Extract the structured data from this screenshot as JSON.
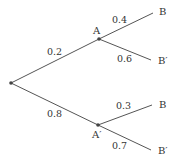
{
  "tree": {
    "root": {
      "x": 11,
      "y": 83
    },
    "nodes": [
      {
        "id": "A",
        "label": "A",
        "x": 99,
        "y": 39,
        "lx": 93,
        "ly": 34
      },
      {
        "id": "A_prime",
        "label": "A′",
        "x": 98,
        "y": 125,
        "lx": 92,
        "ly": 138
      }
    ],
    "leaves": [
      {
        "id": "B_upper",
        "label": "B",
        "x": 153,
        "y": 13,
        "lx": 159,
        "ly": 15
      },
      {
        "id": "Bp_upper",
        "label": "B′",
        "x": 151,
        "y": 60,
        "lx": 158,
        "ly": 64
      },
      {
        "id": "B_lower",
        "label": "B",
        "x": 152,
        "y": 105,
        "lx": 159,
        "ly": 108
      },
      {
        "id": "Bp_lower",
        "label": "B′",
        "x": 151,
        "y": 150,
        "lx": 158,
        "ly": 154
      }
    ],
    "edges": [
      {
        "from": "root",
        "to": "A",
        "prob": "0.2",
        "px": 47,
        "py": 55
      },
      {
        "from": "root",
        "to": "A_prime",
        "prob": "0.8",
        "px": 47,
        "py": 117
      },
      {
        "from": "A",
        "to": "B_upper",
        "prob": "0.4",
        "px": 112,
        "py": 23
      },
      {
        "from": "A",
        "to": "Bp_upper",
        "prob": "0.6",
        "px": 117,
        "py": 62
      },
      {
        "from": "A_prime",
        "to": "B_lower",
        "prob": "0.3",
        "px": 116,
        "py": 109
      },
      {
        "from": "A_prime",
        "to": "Bp_lower",
        "prob": "0.7",
        "px": 112,
        "py": 149
      }
    ]
  }
}
